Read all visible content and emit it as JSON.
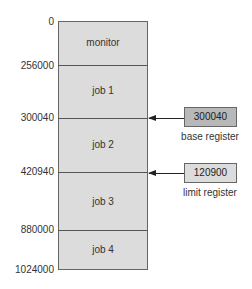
{
  "addresses": [
    "0",
    "256000",
    "300040",
    "420940",
    "880000",
    "1024000"
  ],
  "segments": [
    "monitor",
    "job 1",
    "job 2",
    "job 3",
    "job 4"
  ],
  "registers": {
    "base": {
      "value": "300040",
      "label": "base register",
      "color": "#b8b8b8"
    },
    "limit": {
      "value": "120900",
      "label": "limit register",
      "color": "#dcdcdc"
    }
  },
  "colors": {
    "memory_fill": "#dcdcdc",
    "border": "#666666"
  }
}
